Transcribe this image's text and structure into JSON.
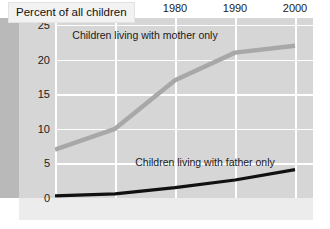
{
  "title": {
    "text": "Percent of all children"
  },
  "chart_data": {
    "type": "line",
    "title": "Percent of all children",
    "xlabel": "",
    "ylabel": "",
    "x": [
      1960,
      1970,
      1980,
      1990,
      2000
    ],
    "xticklabels": [
      "1960",
      "1970",
      "1980",
      "1990",
      "2000"
    ],
    "xlim": [
      1960,
      2003
    ],
    "ylim": [
      0,
      26
    ],
    "yticks": [
      0,
      5,
      10,
      15,
      20,
      25
    ],
    "yticklabels": [
      "0",
      "5",
      "10",
      "15",
      "20",
      "25"
    ],
    "grid": true,
    "legend_position": "inline-annotation",
    "series": [
      {
        "name": "Children living with mother only",
        "color": "#a8a8a8",
        "values": [
          7,
          10,
          17,
          21,
          22
        ]
      },
      {
        "name": "Children living with father only",
        "color": "#111111",
        "values": [
          0.3,
          0.6,
          1.5,
          2.6,
          4.1
        ]
      }
    ],
    "annotations": [
      {
        "text": "Children living with mother only",
        "x": 1975,
        "y": 23.5
      },
      {
        "text": "Children living with father only",
        "x": 1985,
        "y": 5.2
      }
    ]
  },
  "colors": {
    "background": "#d6d6d6",
    "gridline": "#ffffff",
    "mother_series": "#a8a8a8",
    "father_series": "#111111",
    "left_band": "#b9b9b9",
    "title_chip": "#f2f2f2"
  }
}
